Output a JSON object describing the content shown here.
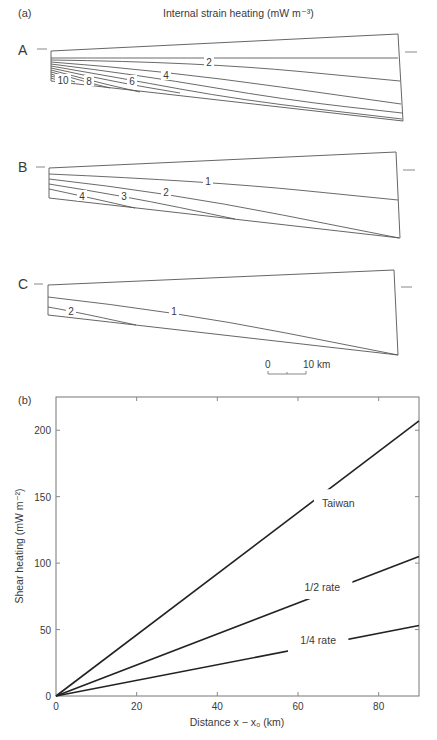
{
  "panel_a": {
    "label": "(a)",
    "title": "Internal strain heating (mW m⁻³)",
    "unit": "mW m-3",
    "scale_bar": {
      "start_label": "0",
      "end_label": "10 km",
      "length_km": 10
    },
    "sections": [
      {
        "name": "A",
        "corners": {
          "tl": [
            51,
            51
          ],
          "bl": [
            51,
            81
          ],
          "tr": [
            398,
            34
          ],
          "br": [
            403,
            121
          ]
        },
        "marker_left": [
          37,
          47,
          49
        ],
        "marker_right": [
          405,
          417,
          52
        ],
        "contour_labels": [
          {
            "text": "2",
            "x": 209,
            "y": 62
          },
          {
            "text": "4",
            "x": 166,
            "y": 75
          },
          {
            "text": "6",
            "x": 132,
            "y": 81
          },
          {
            "text": "8",
            "x": 89,
            "y": 81
          },
          {
            "text": "10",
            "x": 63,
            "y": 80
          }
        ],
        "contours": [
          [
            [
              51,
              58
            ],
            [
              200,
              58
            ],
            [
              398,
              58
            ]
          ],
          [
            [
              51,
              60
            ],
            [
              200,
              62
            ],
            [
              400,
              81
            ]
          ],
          [
            [
              51,
              62
            ],
            [
              160,
              70
            ],
            [
              401,
              104
            ]
          ],
          [
            [
              51,
              64
            ],
            [
              140,
              75
            ],
            [
              286,
              100
            ],
            [
              402,
              113
            ]
          ],
          [
            [
              51,
              66
            ],
            [
              120,
              78
            ],
            [
              240,
              100
            ],
            [
              402,
              119
            ]
          ],
          [
            [
              51,
              68
            ],
            [
              110,
              81
            ],
            [
              180,
              93
            ]
          ],
          [
            [
              51,
              70
            ],
            [
              100,
              83
            ],
            [
              140,
              92
            ]
          ],
          [
            [
              51,
              72
            ],
            [
              90,
              83
            ],
            [
              110,
              88
            ]
          ],
          [
            [
              51,
              74
            ],
            [
              75,
              82
            ]
          ],
          [
            [
              51,
              76
            ],
            [
              68,
              81
            ]
          ],
          [
            [
              51,
              78
            ],
            [
              60,
              81
            ]
          ]
        ]
      },
      {
        "name": "B",
        "corners": {
          "tl": [
            49,
            168
          ],
          "bl": [
            49,
            198
          ],
          "tr": [
            396,
            152
          ],
          "br": [
            400,
            238
          ]
        },
        "marker_left": [
          36,
          45,
          167
        ],
        "marker_right": [
          403,
          415,
          170
        ],
        "contour_labels": [
          {
            "text": "1",
            "x": 208,
            "y": 181
          },
          {
            "text": "2",
            "x": 166,
            "y": 192
          },
          {
            "text": "3",
            "x": 124,
            "y": 196
          },
          {
            "text": "4",
            "x": 82,
            "y": 196
          }
        ],
        "contours": [
          [
            [
              49,
              174
            ],
            [
              208,
              181
            ],
            [
              398,
              200
            ]
          ],
          [
            [
              49,
              179
            ],
            [
              166,
              192
            ],
            [
              399,
              238
            ]
          ],
          [
            [
              49,
              184
            ],
            [
              124,
              196
            ],
            [
              235,
              219
            ]
          ],
          [
            [
              49,
              189
            ],
            [
              82,
              196
            ],
            [
              135,
              208
            ]
          ]
        ]
      },
      {
        "name": "C",
        "corners": {
          "tl": [
            48,
            285
          ],
          "bl": [
            48,
            315
          ],
          "tr": [
            394,
            270
          ],
          "br": [
            398,
            355
          ]
        },
        "marker_left": [
          34,
          43,
          284
        ],
        "marker_right": [
          401,
          412,
          287
        ],
        "contour_labels": [
          {
            "text": "1",
            "x": 174,
            "y": 311
          },
          {
            "text": "2",
            "x": 71,
            "y": 311
          }
        ],
        "contours": [
          [
            [
              48,
              297
            ],
            [
              174,
              311
            ],
            [
              398,
              355
            ]
          ],
          [
            [
              48,
              307
            ],
            [
              71,
              311
            ],
            [
              136,
              325
            ]
          ]
        ]
      }
    ]
  },
  "panel_b": {
    "label": "(b)",
    "frame": {
      "left": 56,
      "right": 419,
      "top": 397,
      "bottom": 696
    },
    "x_ticks": [
      {
        "value": 0,
        "label": "0"
      },
      {
        "value": 20,
        "label": "20"
      },
      {
        "value": 40,
        "label": "40"
      },
      {
        "value": 60,
        "label": "60"
      },
      {
        "value": 80,
        "label": "80"
      }
    ],
    "y_ticks": [
      {
        "value": 0,
        "label": "0"
      },
      {
        "value": 50,
        "label": "50"
      },
      {
        "value": 100,
        "label": "100"
      },
      {
        "value": 150,
        "label": "150"
      },
      {
        "value": 200,
        "label": "200"
      }
    ],
    "xlabel": "Distance x − x₀ (km)",
    "ylabel": "Shear heating (mW m⁻²)"
  },
  "chart_data": [
    {
      "type": "heatmap",
      "title": "Internal strain heating (mW m-3)",
      "panel": "(a)",
      "description": "Contour plots of internal strain heating within a wedge cross-section for three cases",
      "cases": [
        {
          "name": "A",
          "contour_levels": [
            1,
            2,
            3,
            4,
            5,
            6,
            7,
            8,
            9,
            10
          ],
          "labeled_levels": [
            2,
            4,
            6,
            8,
            10
          ]
        },
        {
          "name": "B",
          "contour_levels": [
            1,
            2,
            3,
            4
          ],
          "labeled_levels": [
            1,
            2,
            3,
            4
          ]
        },
        {
          "name": "C",
          "contour_levels": [
            1,
            2
          ],
          "labeled_levels": [
            1,
            2
          ]
        }
      ],
      "scale_bar": "0 - 10 km"
    },
    {
      "type": "line",
      "panel": "(b)",
      "title": "",
      "xlabel": "Distance x − x0 (km)",
      "ylabel": "Shear heating (mW m-2)",
      "xlim": [
        0,
        90
      ],
      "ylim": [
        0,
        225
      ],
      "x_ticks": [
        0,
        20,
        40,
        60,
        80
      ],
      "y_ticks": [
        0,
        50,
        100,
        150,
        200
      ],
      "grid": false,
      "legend": "inline labels",
      "x": [
        0,
        90
      ],
      "series": [
        {
          "name": "Taiwan",
          "values": [
            0,
            207
          ],
          "label_at": [
            70,
            142
          ]
        },
        {
          "name": "1/2 rate",
          "values": [
            0,
            105
          ],
          "label_at": [
            66,
            79
          ]
        },
        {
          "name": "1/4 rate",
          "values": [
            0,
            53
          ],
          "label_at": [
            65,
            39
          ]
        }
      ]
    }
  ]
}
